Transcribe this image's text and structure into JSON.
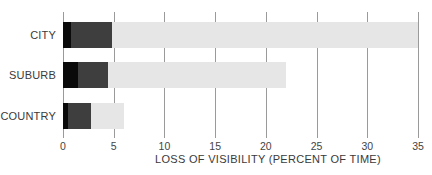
{
  "chart_data": {
    "type": "bar",
    "orientation": "horizontal",
    "stacked": true,
    "title": "",
    "xlabel": "LOSS OF VISIBILITY (PERCENT OF TIME)",
    "ylabel": "",
    "categories": [
      "CITY",
      "SUBURB",
      "COUNTRY"
    ],
    "xlim": [
      0,
      35
    ],
    "x_ticks": [
      0,
      5,
      10,
      15,
      20,
      25,
      30,
      35
    ],
    "grid": true,
    "legend": null,
    "series": [
      {
        "name": "segment-black",
        "color": "#0a0a0a",
        "values": [
          0.8,
          1.5,
          0.5
        ]
      },
      {
        "name": "segment-dark-gray",
        "color": "#3e3e3e",
        "values": [
          4.0,
          2.9,
          2.3
        ]
      },
      {
        "name": "segment-light-gray",
        "color": "#e6e6e6",
        "values": [
          30.2,
          17.6,
          3.2
        ]
      }
    ],
    "totals": [
      35,
      22,
      6
    ]
  },
  "labels": {
    "categories": [
      "CITY",
      "SUBURB",
      "COUNTRY"
    ],
    "ticks": [
      "0",
      "5",
      "10",
      "15",
      "20",
      "25",
      "30",
      "35"
    ],
    "xlabel": "LOSS OF VISIBILITY (PERCENT OF TIME)"
  }
}
